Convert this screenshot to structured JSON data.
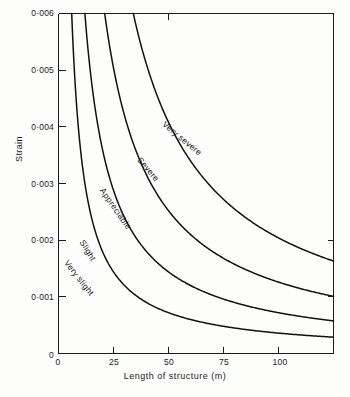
{
  "figure": {
    "background_color": "#fdfdfc",
    "ink_color": "#111111"
  },
  "chart_data": {
    "type": "line",
    "title": "",
    "subtitle": "",
    "xlabel": "Length of structure (m)",
    "ylabel": "Strain",
    "xlim": [
      0,
      125
    ],
    "ylim": [
      0,
      0.006
    ],
    "grid": false,
    "legend_position": "inline-curve-labels",
    "xticks": [
      0,
      25,
      50,
      75,
      100
    ],
    "xtick_labels": [
      "0",
      "25",
      "50",
      "75",
      "100"
    ],
    "yticks": [
      0,
      0.001,
      0.002,
      0.003,
      0.004,
      0.005,
      0.006
    ],
    "ytick_labels": [
      "0",
      "0·001",
      "0·002",
      "0·003",
      "0·004",
      "0·005",
      "0·006"
    ],
    "note": "Each damage-category boundary is a hyperbola of constant strain x length; curves run from strain 0.006 at the top of the axis down to the right-hand edge at 125 m.",
    "series": [
      {
        "name": "Very slight",
        "label": "Very slight",
        "constant_m": 0.036,
        "x": [
          6,
          8,
          10,
          12.5,
          15,
          20,
          25,
          30,
          40,
          50,
          60,
          75,
          90,
          100,
          110,
          125
        ],
        "y": [
          0.006,
          0.0045,
          0.0036,
          0.00288,
          0.0024,
          0.0018,
          0.00144,
          0.0012,
          0.0009,
          0.00072,
          0.0006,
          0.00048,
          0.0004,
          0.00036,
          0.00033,
          0.00029
        ]
      },
      {
        "name": "Slight",
        "label": "Slight",
        "constant_m": 0.072,
        "x": [
          12,
          15,
          20,
          25,
          30,
          40,
          50,
          60,
          75,
          90,
          100,
          110,
          125
        ],
        "y": [
          0.006,
          0.0048,
          0.0036,
          0.00288,
          0.0024,
          0.0018,
          0.00144,
          0.0012,
          0.00096,
          0.0008,
          0.00072,
          0.00065,
          0.00058
        ]
      },
      {
        "name": "Appreciable",
        "label": "Appreciable",
        "constant_m": 0.126,
        "x": [
          21,
          25,
          30,
          40,
          50,
          60,
          75,
          90,
          100,
          110,
          125
        ],
        "y": [
          0.006,
          0.00504,
          0.0042,
          0.00315,
          0.00252,
          0.0021,
          0.00168,
          0.0014,
          0.00126,
          0.00115,
          0.00101
        ]
      },
      {
        "name": "Very severe",
        "label": "Very severe",
        "constant_m": 0.204,
        "x": [
          34,
          40,
          50,
          60,
          75,
          90,
          100,
          110,
          125
        ],
        "y": [
          0.006,
          0.0051,
          0.00408,
          0.0034,
          0.00272,
          0.00227,
          0.00204,
          0.00185,
          0.00163
        ]
      }
    ],
    "curve_labels": [
      {
        "text": "Very severe",
        "rotation_deg": 40
      },
      {
        "text": "Severe",
        "rotation_deg": 50
      },
      {
        "text": "Appreciable",
        "rotation_deg": 55
      },
      {
        "text": "Slight",
        "rotation_deg": 58
      },
      {
        "text": "Very slight",
        "rotation_deg": 52
      }
    ]
  },
  "axes": {
    "y_title": "Strain",
    "x_title": "Length of structure (m)"
  },
  "labels": {
    "very_severe": "Very severe",
    "severe": "Severe",
    "appreciable": "Appreciable",
    "slight": "Slight",
    "very_slight": "Very slight"
  },
  "yticks": [
    {
      "value": "0·006"
    },
    {
      "value": "0·005"
    },
    {
      "value": "0·004"
    },
    {
      "value": "0·003"
    },
    {
      "value": "0·002"
    },
    {
      "value": "0·001"
    },
    {
      "value": "0"
    }
  ],
  "xticks": [
    {
      "value": "0"
    },
    {
      "value": "25"
    },
    {
      "value": "50"
    },
    {
      "value": "75"
    },
    {
      "value": "100"
    }
  ]
}
